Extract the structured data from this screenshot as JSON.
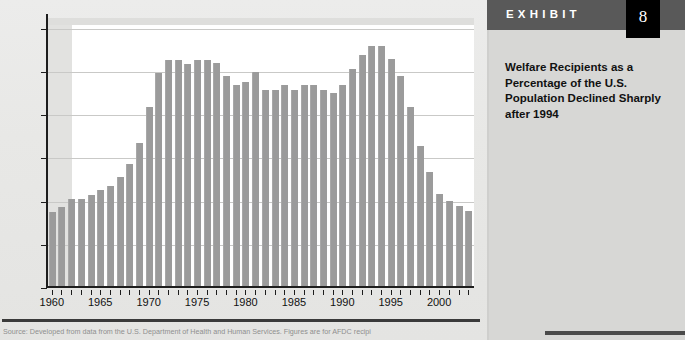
{
  "exhibit": {
    "label": "EXHIBIT",
    "number": "8",
    "caption": "Welfare Recipients as a Percentage of the U.S. Population Declined Sharply after 1994"
  },
  "source_note": "Source: Developed from data from the U.S. Department of Health and Human Services. Figures are for AFDC recipi",
  "chart_data": {
    "type": "bar",
    "title": "",
    "xlabel": "",
    "ylabel": "Percentage of population",
    "ylim": [
      0,
      6.2
    ],
    "yticks": [
      0,
      1,
      2,
      3,
      4,
      5,
      6
    ],
    "ytick_labels": [
      "0",
      "1",
      "2",
      "3",
      "4",
      "5",
      "6"
    ],
    "xtick_labels": [
      "1960",
      "1965",
      "1970",
      "1975",
      "1980",
      "1985",
      "1990",
      "1995",
      "2000"
    ],
    "xticks": [
      1960,
      1965,
      1970,
      1975,
      1980,
      1985,
      1990,
      1995,
      2000
    ],
    "xlim": [
      1959.4,
      2003.6
    ],
    "grid": true,
    "legend": "none",
    "bar_color": "#9b9b9b",
    "categories": [
      "1960",
      "1961",
      "1962",
      "1963",
      "1964",
      "1965",
      "1966",
      "1967",
      "1968",
      "1969",
      "1970",
      "1971",
      "1972",
      "1973",
      "1974",
      "1975",
      "1976",
      "1977",
      "1978",
      "1979",
      "1980",
      "1981",
      "1982",
      "1983",
      "1984",
      "1985",
      "1986",
      "1987",
      "1988",
      "1989",
      "1990",
      "1991",
      "1992",
      "1993",
      "1994",
      "1995",
      "1996",
      "1997",
      "1998",
      "1999",
      "2000",
      "2001",
      "2002",
      "2003"
    ],
    "values": [
      1.72,
      1.82,
      2.01,
      2.01,
      2.11,
      2.21,
      2.32,
      2.52,
      2.82,
      3.32,
      4.13,
      4.93,
      5.23,
      5.24,
      5.13,
      5.23,
      5.24,
      5.15,
      4.85,
      4.65,
      4.71,
      4.94,
      4.54,
      4.54,
      4.64,
      4.54,
      4.65,
      4.65,
      4.54,
      4.46,
      4.65,
      5.03,
      5.35,
      5.55,
      5.56,
      5.26,
      4.85,
      4.15,
      3.25,
      2.63,
      2.14,
      1.96,
      1.86,
      1.74
    ]
  }
}
